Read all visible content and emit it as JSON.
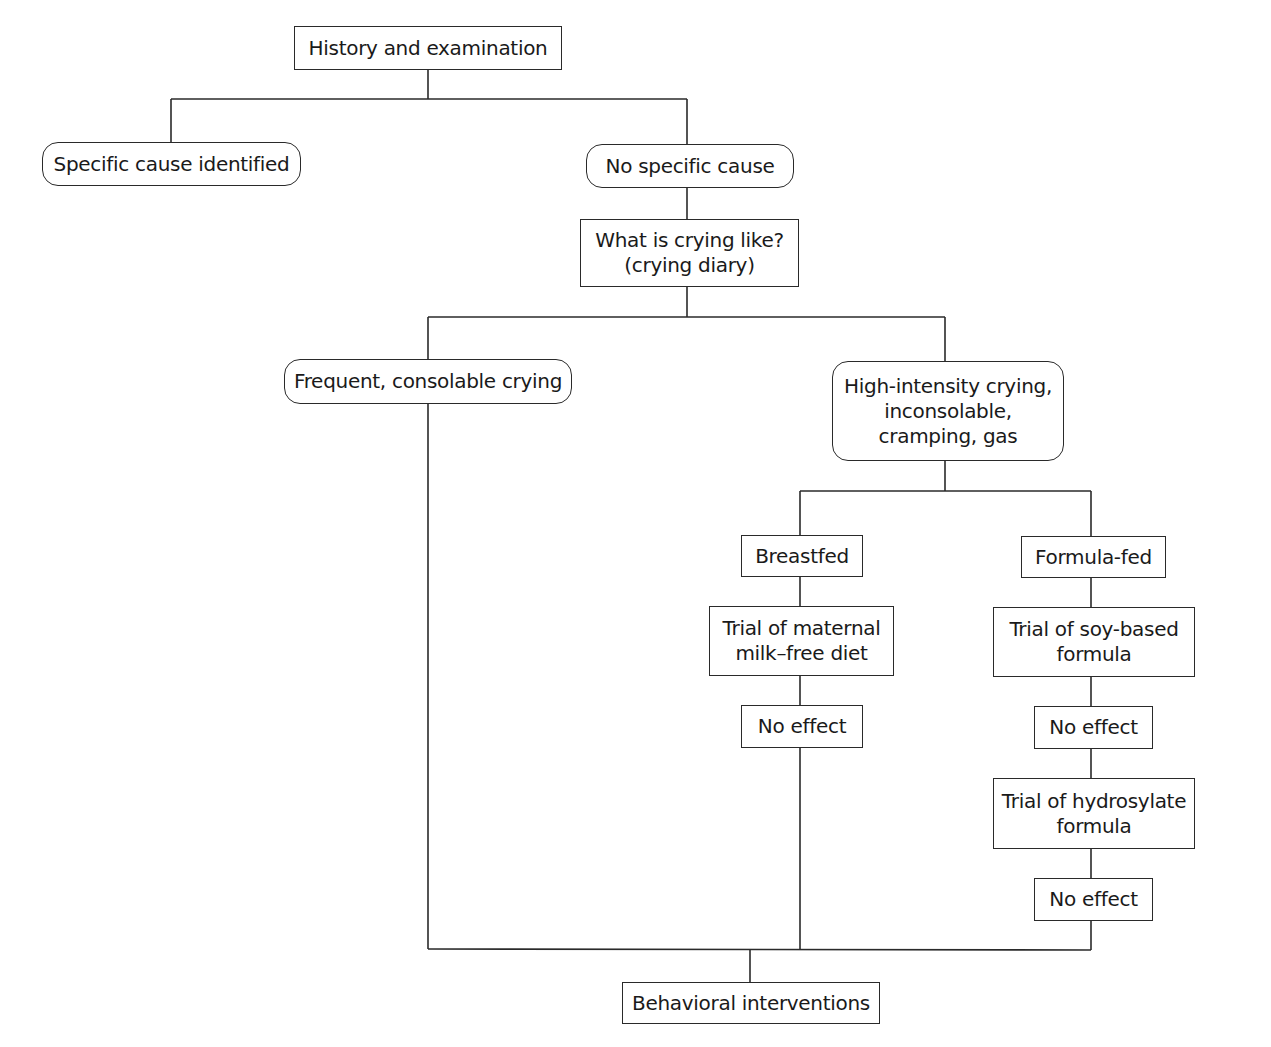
{
  "diagram": {
    "type": "flowchart",
    "nodes": [
      {
        "id": "history",
        "label": "History and examination",
        "shape": "rect"
      },
      {
        "id": "specific_cause",
        "label": "Specific cause identified",
        "shape": "rounded"
      },
      {
        "id": "no_specific_cause",
        "label": "No specific cause",
        "shape": "rounded"
      },
      {
        "id": "crying_like",
        "label": "What is crying like?\n(crying diary)",
        "shape": "rect"
      },
      {
        "id": "frequent_consolable",
        "label": "Frequent, consolable crying",
        "shape": "rounded"
      },
      {
        "id": "high_intensity",
        "label": "High-intensity crying,\ninconsolable,\ncramping, gas",
        "shape": "rounded"
      },
      {
        "id": "breastfed",
        "label": "Breastfed",
        "shape": "rect"
      },
      {
        "id": "formula_fed",
        "label": "Formula-fed",
        "shape": "rect"
      },
      {
        "id": "maternal_diet",
        "label": "Trial of maternal\nmilk–free diet",
        "shape": "rect"
      },
      {
        "id": "soy_formula",
        "label": "Trial of soy-based\nformula",
        "shape": "rect"
      },
      {
        "id": "no_effect_1",
        "label": "No effect",
        "shape": "rect"
      },
      {
        "id": "no_effect_2",
        "label": "No effect",
        "shape": "rect"
      },
      {
        "id": "hydrosylate_formula",
        "label": "Trial of hydrosylate\nformula",
        "shape": "rect"
      },
      {
        "id": "no_effect_3",
        "label": "No effect",
        "shape": "rect"
      },
      {
        "id": "behavioral",
        "label": "Behavioral interventions",
        "shape": "rect"
      }
    ],
    "edges": [
      {
        "from": "history",
        "to": "specific_cause"
      },
      {
        "from": "history",
        "to": "no_specific_cause"
      },
      {
        "from": "no_specific_cause",
        "to": "crying_like"
      },
      {
        "from": "crying_like",
        "to": "frequent_consolable"
      },
      {
        "from": "crying_like",
        "to": "high_intensity"
      },
      {
        "from": "high_intensity",
        "to": "breastfed"
      },
      {
        "from": "high_intensity",
        "to": "formula_fed"
      },
      {
        "from": "breastfed",
        "to": "maternal_diet"
      },
      {
        "from": "maternal_diet",
        "to": "no_effect_1"
      },
      {
        "from": "formula_fed",
        "to": "soy_formula"
      },
      {
        "from": "soy_formula",
        "to": "no_effect_2"
      },
      {
        "from": "no_effect_2",
        "to": "hydrosylate_formula"
      },
      {
        "from": "hydrosylate_formula",
        "to": "no_effect_3"
      },
      {
        "from": "frequent_consolable",
        "to": "behavioral"
      },
      {
        "from": "no_effect_1",
        "to": "behavioral"
      },
      {
        "from": "no_effect_3",
        "to": "behavioral"
      }
    ]
  },
  "colors": {
    "line": "#2a2a2a",
    "background": "#ffffff",
    "text": "#1a1a1a"
  }
}
